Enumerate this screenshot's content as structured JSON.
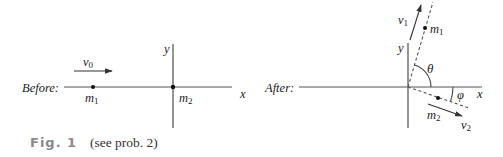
{
  "figure": {
    "caption_label": "Fig. 1",
    "caption_text": "(see prob. 2)"
  },
  "before": {
    "title": "Before:",
    "velocity_label": "v",
    "velocity_sub": "0",
    "mass1_label": "m",
    "mass1_sub": "1",
    "mass2_label": "m",
    "mass2_sub": "2",
    "x_axis_label": "x",
    "y_axis_label": "y"
  },
  "after": {
    "title": "After:",
    "v1_label": "v",
    "v1_sub": "1",
    "v2_label": "v",
    "v2_sub": "2",
    "mass1_label": "m",
    "mass1_sub": "1",
    "mass2_label": "m",
    "mass2_sub": "2",
    "theta_label": "θ",
    "phi_label": "φ",
    "x_axis_label": "x",
    "y_axis_label": "y"
  },
  "colors": {
    "axis": "#7a7a7a",
    "ink": "#222222",
    "caption_label": "#8a8a8a"
  }
}
